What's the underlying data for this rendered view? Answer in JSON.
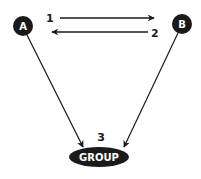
{
  "diagram": {
    "nodes": {
      "a": {
        "label": "A",
        "shape": "circle",
        "fill": "#1a1a1a"
      },
      "b": {
        "label": "B",
        "shape": "circle",
        "fill": "#1a1a1a"
      },
      "group": {
        "label": "GROUP",
        "shape": "ellipse",
        "fill": "#1a1a1a"
      }
    },
    "edges": [
      {
        "from": "A",
        "to": "B",
        "label": "1"
      },
      {
        "from": "B",
        "to": "A",
        "label": "2"
      },
      {
        "from": "A",
        "to": "GROUP",
        "label": ""
      },
      {
        "from": "B",
        "to": "GROUP",
        "label": ""
      }
    ],
    "step_labels": {
      "one": "1",
      "two": "2",
      "three": "3"
    },
    "colors": {
      "ink": "#1a1a1a",
      "background": "#ffffff",
      "text_on_node": "#ffffff"
    }
  }
}
